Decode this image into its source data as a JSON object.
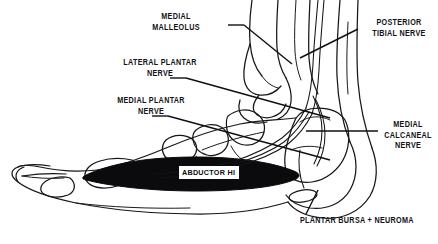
{
  "figure": {
    "kind": "medical-illustration",
    "background_color": "#ffffff",
    "line_color": "#16161a",
    "muscle_band_color": "#0b0b0d"
  },
  "labels": {
    "medial_malleolus": "MEDIAL\nMALLEOLUS",
    "lateral_plantar_nerve": "LATERAL PLANTAR\nNERVE",
    "medial_plantar_nerve": "MEDIAL PLANTAR\nNERVE",
    "posterior_tibial_nerve": "POSTERIOR\nTIBIAL NERVE",
    "medial_calcaneal_nerve": "MEDIAL\nCALCANEAL\nNERVE",
    "plantar_bursa_neuroma": "PLANTAR BURSA + NEUROMA"
  },
  "muscle_band": {
    "caption": "ABDUCTOR HI"
  },
  "structures": [
    "tibia",
    "fibula",
    "medial malleolus",
    "talus",
    "calcaneus",
    "navicular",
    "cuneiform",
    "metatarsal",
    "phalanx",
    "abductor hallucis muscle",
    "plantar bursa",
    "posterior tibial nerve",
    "medial plantar nerve",
    "lateral plantar nerve",
    "medial calcaneal nerve"
  ]
}
